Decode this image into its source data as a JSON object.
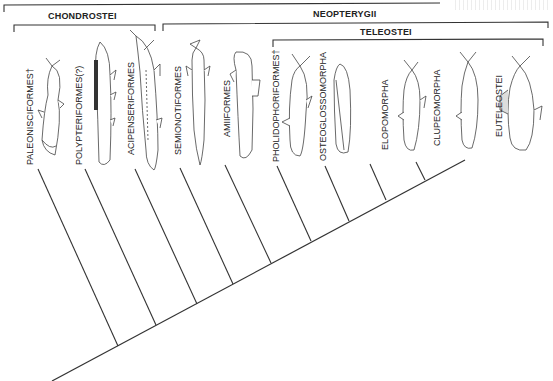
{
  "diagram": {
    "type": "cladogram",
    "top_group": {
      "label": "",
      "note": "label cut off at top edge"
    },
    "groups": [
      {
        "id": "chondrostei",
        "label": "CHONDROSTEI"
      },
      {
        "id": "neopterygii",
        "label": "NEOPTERYGII"
      },
      {
        "id": "teleostei",
        "label": "TELEOSTEI"
      }
    ],
    "taxa": [
      {
        "id": "paleonisciformes",
        "label": "PALEONISCIFORMES†",
        "extinct": true,
        "illustration": "paleoniscid-fish"
      },
      {
        "id": "polypteriformes",
        "label": "POLYPTERIFORMES(?)",
        "extinct": false,
        "illustration": "bichir-fish"
      },
      {
        "id": "acipenseriformes",
        "label": "ACIPENSERIFORMES",
        "extinct": false,
        "illustration": "sturgeon-fish"
      },
      {
        "id": "semionotiformes",
        "label": "SEMIONOTIFORMES",
        "extinct": false,
        "illustration": "gar-fish"
      },
      {
        "id": "amiiformes",
        "label": "AMIIFORMES",
        "extinct": false,
        "illustration": "bowfin-fish"
      },
      {
        "id": "pholidophoriformes",
        "label": "PHOLIDOPHORIFORMES†",
        "extinct": true,
        "illustration": "pholidophorid-fish"
      },
      {
        "id": "osteoglossomorpha",
        "label": "OSTEOGLOSSOMORPHA",
        "extinct": false,
        "illustration": "bonytongue-fish"
      },
      {
        "id": "elopomorpha",
        "label": "ELOPOMORPHA",
        "extinct": false,
        "illustration": "tarpon-fish"
      },
      {
        "id": "clupeomorpha",
        "label": "CLUPEOMORPHA",
        "extinct": false,
        "illustration": "herring-fish"
      },
      {
        "id": "euteleostei",
        "label": "EUTELEOSTEI",
        "extinct": false,
        "illustration": "perch-fish"
      }
    ]
  }
}
